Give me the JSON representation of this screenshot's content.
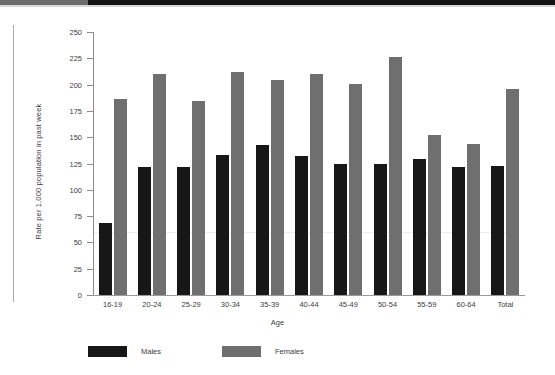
{
  "page": {
    "background_color": "#ffffff",
    "scan_band_gray": "#6d6d6d",
    "scan_band_black": "#131313"
  },
  "chart_data": {
    "type": "bar",
    "title": "",
    "subtitle": "",
    "xlabel": "Age",
    "ylabel": "Rate per 1,000 population in past week",
    "categories": [
      "16-19",
      "20-24",
      "25-29",
      "30-34",
      "35-39",
      "40-44",
      "45-49",
      "50-54",
      "55-59",
      "60-64",
      "Total"
    ],
    "series": [
      {
        "name": "Males",
        "color": "#171717",
        "values": [
          68,
          122,
          122,
          133,
          143,
          132,
          125,
          125,
          129,
          122,
          123
        ]
      },
      {
        "name": "Females",
        "color": "#6f6f6f",
        "values": [
          186,
          210,
          184,
          212,
          204,
          210,
          201,
          226,
          152,
          144,
          196
        ]
      }
    ],
    "ylim": [
      0,
      250
    ],
    "yticks": [
      0,
      25,
      50,
      75,
      100,
      125,
      150,
      175,
      200,
      225,
      250
    ],
    "ytick_labels": [
      "0",
      "25",
      "50",
      "75",
      "100",
      "125",
      "150",
      "175",
      "200",
      "225",
      "250"
    ],
    "grid": false,
    "legend_position": "bottom-left",
    "legend_entries": [
      "Males",
      "Females"
    ]
  }
}
